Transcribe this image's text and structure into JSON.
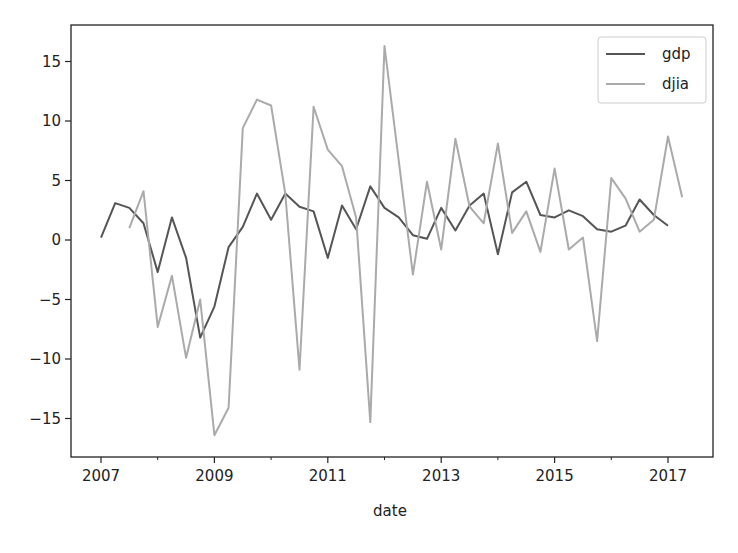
{
  "chart_data": {
    "type": "line",
    "title": "",
    "xlabel": "date",
    "ylabel": "",
    "xlim": [
      2006.6,
      2017.8
    ],
    "ylim": [
      -18.2,
      18
    ],
    "x_ticks": [
      2007,
      2009,
      2011,
      2013,
      2015,
      2017
    ],
    "x_tick_labels": [
      "2007",
      "2009",
      "2011",
      "2013",
      "2015",
      "2017"
    ],
    "x_minor_ticks": [
      2008,
      2010,
      2012,
      2014,
      2016
    ],
    "y_ticks": [
      15,
      10,
      5,
      0,
      -5,
      -10,
      -15
    ],
    "y_tick_labels": [
      "15",
      "10",
      "5",
      "0",
      "−5",
      "−10",
      "−15"
    ],
    "grid": false,
    "legend_position": "upper right",
    "series": [
      {
        "name": "gdp",
        "color": "#555555",
        "x": [
          2007.0,
          2007.25,
          2007.5,
          2007.75,
          2008.0,
          2008.25,
          2008.5,
          2008.75,
          2009.0,
          2009.25,
          2009.5,
          2009.75,
          2010.0,
          2010.25,
          2010.5,
          2010.75,
          2011.0,
          2011.25,
          2011.5,
          2011.75,
          2012.0,
          2012.25,
          2012.5,
          2012.75,
          2013.0,
          2013.25,
          2013.5,
          2013.75,
          2014.0,
          2014.25,
          2014.5,
          2014.75,
          2015.0,
          2015.25,
          2015.5,
          2015.75,
          2016.0,
          2016.25,
          2016.5,
          2016.75,
          2017.0
        ],
        "values": [
          0.2,
          3.1,
          2.7,
          1.4,
          -2.7,
          1.9,
          -1.5,
          -8.2,
          -5.6,
          -0.6,
          1.1,
          3.9,
          1.7,
          3.9,
          2.8,
          2.4,
          -1.5,
          2.9,
          0.9,
          4.5,
          2.7,
          1.9,
          0.4,
          0.1,
          2.7,
          0.8,
          2.9,
          3.9,
          -1.2,
          4.0,
          4.9,
          2.1,
          1.9,
          2.5,
          2.0,
          0.9,
          0.7,
          1.2,
          3.4,
          2.1,
          1.2
        ]
      },
      {
        "name": "djia",
        "color": "#aaaaaa",
        "x": [
          2007.5,
          2007.75,
          2008.0,
          2008.25,
          2008.5,
          2008.75,
          2009.0,
          2009.25,
          2009.5,
          2009.75,
          2010.0,
          2010.25,
          2010.5,
          2010.75,
          2011.0,
          2011.25,
          2011.5,
          2011.75,
          2012.0,
          2012.25,
          2012.5,
          2012.75,
          2013.0,
          2013.25,
          2013.5,
          2013.75,
          2014.0,
          2014.25,
          2014.5,
          2014.75,
          2015.0,
          2015.25,
          2015.5,
          2015.75,
          2016.0,
          2016.25,
          2016.5,
          2016.75,
          2017.0,
          2017.25
        ],
        "values": [
          1.0,
          4.1,
          -7.3,
          -3.0,
          -9.9,
          -5.0,
          -16.4,
          -14.1,
          9.4,
          11.8,
          11.3,
          3.9,
          -10.9,
          11.2,
          7.6,
          6.2,
          1.9,
          -15.3,
          16.3,
          6.7,
          -2.9,
          4.9,
          -0.8,
          8.5,
          2.8,
          1.4,
          8.1,
          0.6,
          2.4,
          -1.0,
          6.0,
          -0.8,
          0.2,
          -8.5,
          5.2,
          3.5,
          0.7,
          1.7,
          8.7,
          3.6
        ]
      }
    ]
  },
  "legend": {
    "items": [
      {
        "label": "gdp",
        "color": "#555555"
      },
      {
        "label": "djia",
        "color": "#aaaaaa"
      }
    ]
  }
}
